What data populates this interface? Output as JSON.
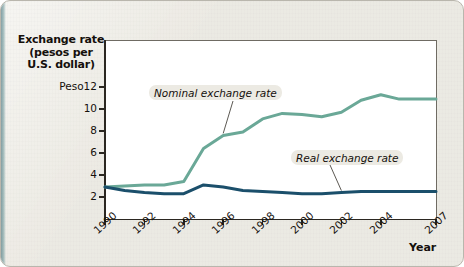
{
  "figure": {
    "background_color": "#eceae3",
    "plot_background_color": "#ffffff"
  },
  "axes": {
    "y_title_line1": "Exchange rate",
    "y_title_line2": "(pesos per",
    "y_title_line3": "U.S. dollar)",
    "x_title": "Year",
    "y_tick_labels": [
      "Peso12",
      "10",
      "8",
      "6",
      "4",
      "2"
    ],
    "x_tick_labels": [
      "1990",
      "1992",
      "1994",
      "1996",
      "1998",
      "2000",
      "2002",
      "2004",
      "2007"
    ]
  },
  "annotations": {
    "nominal_label": "Nominal exchange rate",
    "real_label": "Real exchange rate"
  },
  "chart_data": {
    "type": "line",
    "title": "",
    "subtitle": "",
    "xlabel": "Year",
    "ylabel": "Exchange rate (pesos per U.S. dollar)",
    "ylim": [
      0,
      13
    ],
    "xlim": [
      1990,
      2007
    ],
    "yticks": [
      2,
      4,
      6,
      8,
      10,
      12
    ],
    "ytick_labels": [
      "2",
      "4",
      "6",
      "8",
      "10",
      "Peso12"
    ],
    "xticks": [
      1990,
      1992,
      1994,
      1996,
      1998,
      2000,
      2002,
      2004,
      2007
    ],
    "grid": false,
    "legend": "inline-annotations",
    "x": [
      1990,
      1991,
      1992,
      1993,
      1994,
      1995,
      1996,
      1997,
      1998,
      1999,
      2000,
      2001,
      2002,
      2003,
      2004,
      2005,
      2006,
      2007
    ],
    "series": [
      {
        "name": "Nominal exchange rate",
        "color": "#6aa897",
        "values": [
          2.9,
          3.0,
          3.1,
          3.1,
          3.4,
          6.4,
          7.6,
          7.9,
          9.1,
          9.6,
          9.5,
          9.3,
          9.7,
          10.8,
          11.3,
          10.9,
          10.9,
          10.9
        ]
      },
      {
        "name": "Real exchange rate",
        "color": "#1b4f6b",
        "values": [
          2.9,
          2.6,
          2.4,
          2.3,
          2.3,
          3.1,
          2.9,
          2.6,
          2.5,
          2.4,
          2.3,
          2.3,
          2.4,
          2.5,
          2.5,
          2.5,
          2.5,
          2.5
        ]
      }
    ]
  }
}
